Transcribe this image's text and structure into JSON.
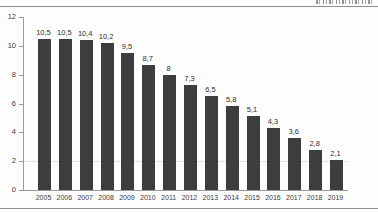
{
  "chart_data": {
    "type": "bar",
    "title": "",
    "xlabel": "",
    "ylabel": "",
    "categories": [
      "2005",
      "2006",
      "2007",
      "2008",
      "2009",
      "2010",
      "2011",
      "2012",
      "2013",
      "2014",
      "2015",
      "2016",
      "2017",
      "2018",
      "2019"
    ],
    "values": [
      10.5,
      10.5,
      10.4,
      10.2,
      9.5,
      8.7,
      8,
      7.3,
      6.5,
      5.8,
      5.1,
      4.3,
      3.6,
      2.8,
      2.1
    ],
    "value_labels": [
      "10,5",
      "10,5",
      "10,4",
      "10,2",
      "9,5",
      "8,7",
      "8",
      "7,3",
      "6,5",
      "5,8",
      "5,1",
      "4,3",
      "3,6",
      "2,8",
      "2,1"
    ],
    "ylim": [
      0,
      12
    ],
    "yticks": [
      0,
      2,
      4,
      6,
      8,
      10,
      12
    ],
    "ytick_labels": [
      "0",
      "2",
      "4",
      "6",
      "8",
      "10",
      "12"
    ],
    "grid": "faint horizontal line at y=2 only",
    "legend": "none",
    "colors": {
      "bar": "#3d3d3d",
      "axis": "#9a9a9a",
      "gridline": "#e3e3e3",
      "value_label": "#2e2e2e",
      "tick_label": "#3a3a3a",
      "rule": "#8e8e8e"
    }
  }
}
